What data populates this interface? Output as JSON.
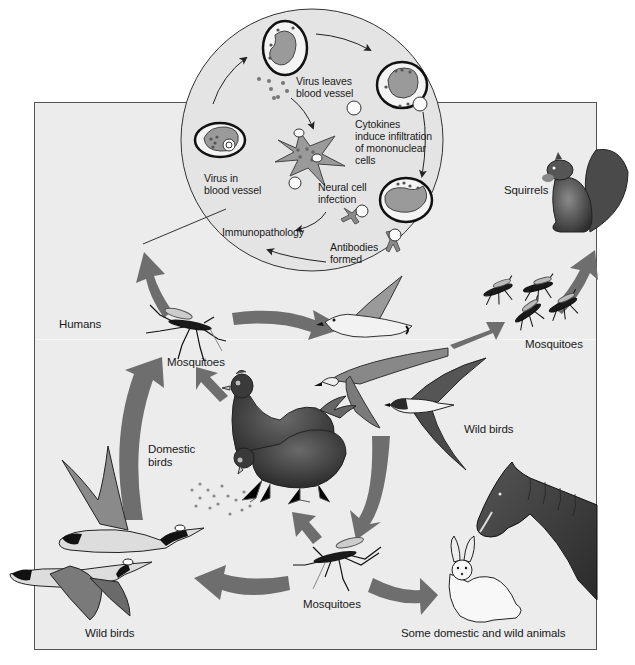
{
  "diagram": {
    "type": "transmission-cycle",
    "colors": {
      "panel_background": "#ececec",
      "circle_background": "#e4e4e4",
      "arrow_fill": "#6e6e6e",
      "cell_fill": "#9a9a9a",
      "outline": "#222222"
    },
    "inset_circle": {
      "labels": {
        "virus_in_blood_vessel": [
          "Virus in",
          "blood vessel"
        ],
        "virus_leaves_blood_vessel": [
          "Virus leaves",
          "blood vessel"
        ],
        "cytokines": [
          "Cytokines",
          "induce infiltration",
          "of mononuclear",
          "cells"
        ],
        "neural_cell_infection": [
          "Neural cell",
          "infection"
        ],
        "immunopathology": "Immunopathology",
        "antibodies_formed": [
          "Antibodies",
          "formed"
        ]
      }
    },
    "hosts": {
      "humans": "Humans",
      "mosquitoes_top": "Mosquitoes",
      "squirrels": "Squirrels",
      "mosquitoes_right": "Mosquitoes",
      "wild_birds_right": "Wild birds",
      "domestic_birds": [
        "Domestic",
        "birds"
      ],
      "wild_birds_left": "Wild birds",
      "mosquitoes_bottom": "Mosquitoes",
      "domestic_wild_animals": "Some domestic and wild animals"
    },
    "icons": [
      "mosquito-icon",
      "squirrel-icon",
      "seabird-icon",
      "swallow-icon",
      "chicken-icon",
      "goose-icon",
      "rabbit-icon",
      "horse-icon",
      "antibody-icon",
      "neural-cell-icon",
      "blood-vessel-cell-icon"
    ]
  }
}
